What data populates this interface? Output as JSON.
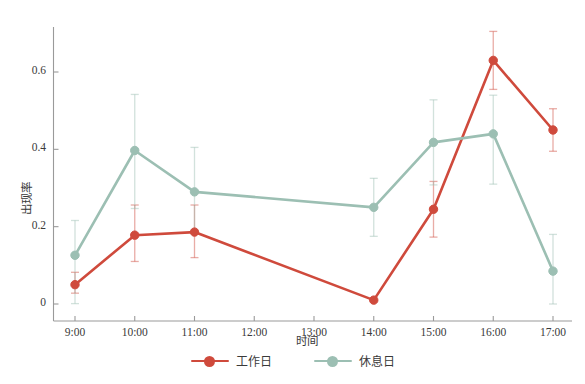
{
  "chart_data": {
    "type": "line",
    "title": "",
    "xlabel": "时间",
    "ylabel": "出现率",
    "grid": false,
    "legend_position": "bottom-center",
    "x": [
      "9:00",
      "10:00",
      "11:00",
      "12:00",
      "13:00",
      "14:00",
      "15:00",
      "16:00",
      "17:00"
    ],
    "xtick_labels": [
      "9:00",
      "10:00",
      "11:00",
      "12:00",
      "13:00",
      "14:00",
      "15:00",
      "16:00",
      "17:00"
    ],
    "ytick_labels": [
      "0",
      "0.2",
      "0.4",
      "0.6"
    ],
    "ytick_values": [
      0,
      0.2,
      0.4,
      0.6
    ],
    "xlim": [
      0,
      8
    ],
    "ylim": [
      -0.04,
      0.72
    ],
    "series": [
      {
        "name": "工作日",
        "color": "#CF4A3C",
        "marker": "circle",
        "x": [
          "9:00",
          "10:00",
          "11:00",
          "14:00",
          "15:00",
          "16:00",
          "17:00"
        ],
        "values": [
          0.05,
          0.178,
          0.186,
          0.01,
          0.245,
          0.63,
          0.45
        ],
        "err_low": [
          0.022,
          0.068,
          0.066,
          0.0,
          0.072,
          0.075,
          0.055
        ],
        "err_high": [
          0.032,
          0.078,
          0.07,
          0.0,
          0.072,
          0.075,
          0.055
        ]
      },
      {
        "name": "休息日",
        "color": "#9CBFB3",
        "marker": "circle",
        "x": [
          "9:00",
          "10:00",
          "11:00",
          "14:00",
          "15:00",
          "16:00",
          "17:00"
        ],
        "values": [
          0.126,
          0.397,
          0.29,
          0.25,
          0.418,
          0.44,
          0.085
        ],
        "err_low": [
          0.125,
          0.15,
          0.105,
          0.075,
          0.11,
          0.13,
          0.085
        ],
        "err_high": [
          0.09,
          0.145,
          0.115,
          0.075,
          0.11,
          0.1,
          0.095
        ]
      }
    ]
  },
  "legend": {
    "items": [
      {
        "label": "工作日",
        "color": "#CF4A3C"
      },
      {
        "label": "休息日",
        "color": "#9CBFB3"
      }
    ]
  },
  "axes": {
    "x_title": "时间",
    "y_title": "出现率"
  }
}
